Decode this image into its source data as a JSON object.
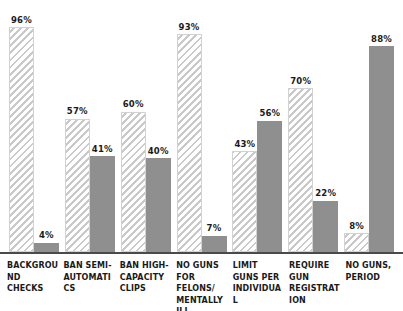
{
  "chart_data": {
    "type": "bar",
    "title": "",
    "subtitle": "",
    "xlabel": "",
    "ylabel": "",
    "ylim": [
      0,
      100
    ],
    "grid": false,
    "legend_position": "none",
    "categories": [
      "Background checks",
      "Ban semi-automatics",
      "Ban high-capacity clips",
      "No guns for felons/ mentally ill",
      "Limit guns per individual",
      "Require gun registration",
      "No guns, period"
    ],
    "series": [
      {
        "name": "series-hatched",
        "style": "hatched",
        "color": "#c9c9c9",
        "values": [
          96,
          57,
          60,
          93,
          43,
          70,
          8
        ]
      },
      {
        "name": "series-solid",
        "style": "solid",
        "color": "#8f8f8f",
        "values": [
          4,
          41,
          40,
          7,
          56,
          22,
          88
        ]
      }
    ],
    "value_labels": [
      [
        "96%",
        "4%"
      ],
      [
        "57%",
        "41%"
      ],
      [
        "60%",
        "40%"
      ],
      [
        "93%",
        "7%"
      ],
      [
        "43%",
        "56%"
      ],
      [
        "70%",
        "22%"
      ],
      [
        "8%",
        "88%"
      ]
    ]
  },
  "axis": {
    "baseline_color": "#4a4a4a"
  },
  "groups": [
    {
      "label": "Background checks",
      "bars": [
        {
          "label": "96%",
          "value": 96,
          "style": "hatched"
        },
        {
          "label": "4%",
          "value": 4,
          "style": "solid"
        }
      ]
    },
    {
      "label": "Ban semi-automatics",
      "bars": [
        {
          "label": "57%",
          "value": 57,
          "style": "hatched"
        },
        {
          "label": "41%",
          "value": 41,
          "style": "solid"
        }
      ]
    },
    {
      "label": "Ban high-capacity clips",
      "bars": [
        {
          "label": "60%",
          "value": 60,
          "style": "hatched"
        },
        {
          "label": "40%",
          "value": 40,
          "style": "solid"
        }
      ]
    },
    {
      "label": "No guns for felons/ mentally ill",
      "bars": [
        {
          "label": "93%",
          "value": 93,
          "style": "hatched"
        },
        {
          "label": "7%",
          "value": 7,
          "style": "solid"
        }
      ]
    },
    {
      "label": "Limit guns per individual",
      "bars": [
        {
          "label": "43%",
          "value": 43,
          "style": "hatched"
        },
        {
          "label": "56%",
          "value": 56,
          "style": "solid"
        }
      ]
    },
    {
      "label": "Require gun registration",
      "bars": [
        {
          "label": "70%",
          "value": 70,
          "style": "hatched"
        },
        {
          "label": "22%",
          "value": 22,
          "style": "solid"
        }
      ]
    },
    {
      "label": "No guns, period",
      "bars": [
        {
          "label": "8%",
          "value": 8,
          "style": "hatched"
        },
        {
          "label": "88%",
          "value": 88,
          "style": "solid"
        }
      ]
    }
  ]
}
